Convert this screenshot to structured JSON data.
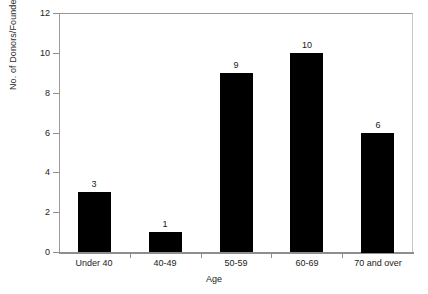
{
  "chart_data": {
    "type": "bar",
    "title": "",
    "categories": [
      "Under 40",
      "40-49",
      "50-59",
      "60-69",
      "70 and over"
    ],
    "values": [
      3,
      1,
      9,
      10,
      6
    ],
    "data_labels": [
      "3",
      "1",
      "9",
      "10",
      "6"
    ],
    "xlabel": "Age",
    "ylabel": "No. of Donors/Founders",
    "ylim": [
      0,
      12
    ],
    "yticks": [
      0,
      2,
      4,
      6,
      8,
      10,
      12
    ],
    "ytick_labels": [
      "0",
      "2",
      "4",
      "6",
      "8",
      "10",
      "12"
    ],
    "grid": false,
    "legend": false,
    "bar_color": "#000000",
    "plot_background": "#ffffff",
    "axis_color": "#8e8e8e"
  }
}
